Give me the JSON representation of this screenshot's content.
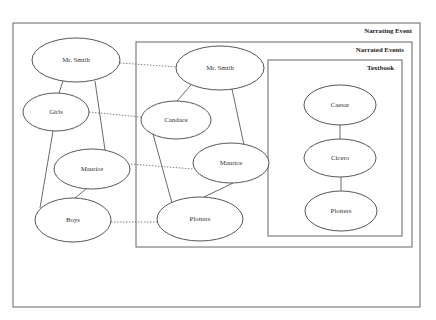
{
  "diagram": {
    "frames": [
      {
        "id": "narrating",
        "label": "Narrating Event",
        "x": 13,
        "y": 23,
        "w": 407,
        "h": 284
      },
      {
        "id": "narrated",
        "label": "Narrated Events",
        "x": 136,
        "y": 42,
        "w": 276,
        "h": 205
      },
      {
        "id": "textbook",
        "label": "Textbook",
        "x": 268,
        "y": 60,
        "w": 134,
        "h": 176
      }
    ],
    "nodes": [
      {
        "id": "n_smith_1",
        "label": "Mr. Smith",
        "cx": 76,
        "cy": 60,
        "rx": 44,
        "ry": 22
      },
      {
        "id": "n_girls",
        "label": "Girls",
        "cx": 56,
        "cy": 112,
        "rx": 33,
        "ry": 19
      },
      {
        "id": "n_maurice_1",
        "label": "Maurice",
        "cx": 92,
        "cy": 169,
        "rx": 38,
        "ry": 20
      },
      {
        "id": "n_boys",
        "label": "Boys",
        "cx": 73,
        "cy": 220,
        "rx": 38,
        "ry": 22
      },
      {
        "id": "n_smith_2",
        "label": "Mr. Smith",
        "cx": 220,
        "cy": 68,
        "rx": 44,
        "ry": 22
      },
      {
        "id": "n_candace",
        "label": "Candace",
        "cx": 176,
        "cy": 120,
        "rx": 35,
        "ry": 19
      },
      {
        "id": "n_maurice_2",
        "label": "Maurice",
        "cx": 231,
        "cy": 163,
        "rx": 38,
        "ry": 20
      },
      {
        "id": "n_plotters_2",
        "label": "Plotters",
        "cx": 200,
        "cy": 219,
        "rx": 43,
        "ry": 22
      },
      {
        "id": "n_caesar",
        "label": "Caesar",
        "cx": 340,
        "cy": 105,
        "rx": 36,
        "ry": 20
      },
      {
        "id": "n_cicero",
        "label": "Cicero",
        "cx": 340,
        "cy": 158,
        "rx": 36,
        "ry": 19
      },
      {
        "id": "n_plotters_3",
        "label": "Plotters",
        "cx": 341,
        "cy": 211,
        "rx": 36,
        "ry": 20
      }
    ],
    "edges": [
      {
        "from": "n_smith_1",
        "to": "n_girls",
        "x1": 63,
        "y1": 81,
        "x2": 59,
        "y2": 93
      },
      {
        "from": "n_smith_1",
        "to": "n_maurice_1",
        "x1": 95,
        "y1": 81,
        "x2": 105,
        "y2": 150
      },
      {
        "from": "n_girls",
        "to": "n_boys",
        "x1": 53,
        "y1": 131,
        "x2": 40,
        "y2": 208
      },
      {
        "from": "n_maurice_1",
        "to": "n_boys",
        "x1": 86,
        "y1": 189,
        "x2": 75,
        "y2": 198
      },
      {
        "from": "n_smith_2",
        "to": "n_candace",
        "x1": 191,
        "y1": 85,
        "x2": 177,
        "y2": 101
      },
      {
        "from": "n_smith_2",
        "to": "n_maurice_2",
        "x1": 232,
        "y1": 89,
        "x2": 244,
        "y2": 145
      },
      {
        "from": "n_candace",
        "to": "n_plotters_2",
        "x1": 153,
        "y1": 134,
        "x2": 172,
        "y2": 203
      },
      {
        "from": "n_maurice_2",
        "to": "n_plotters_2",
        "x1": 233,
        "y1": 183,
        "x2": 204,
        "y2": 197
      },
      {
        "from": "n_caesar",
        "to": "n_cicero",
        "x1": 340,
        "y1": 125,
        "x2": 340,
        "y2": 139
      },
      {
        "from": "n_cicero",
        "to": "n_plotters_3",
        "x1": 341,
        "y1": 177,
        "x2": 341,
        "y2": 191
      }
    ],
    "correspondences": [
      {
        "from": "n_smith_1",
        "to": "n_smith_2",
        "x1": 120,
        "y1": 63,
        "x2": 177,
        "y2": 67
      },
      {
        "from": "n_girls",
        "to": "n_candace",
        "x1": 89,
        "y1": 112,
        "x2": 141,
        "y2": 117
      },
      {
        "from": "n_maurice_1",
        "to": "n_maurice_2",
        "x1": 131,
        "y1": 164,
        "x2": 193,
        "y2": 169
      },
      {
        "from": "n_boys",
        "to": "n_plotters_2",
        "x1": 111,
        "y1": 222,
        "x2": 157,
        "y2": 222
      }
    ]
  }
}
